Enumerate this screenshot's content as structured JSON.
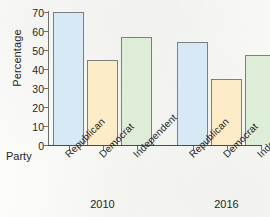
{
  "chart_data": {
    "type": "bar",
    "title": "",
    "xlabel": "Party",
    "ylabel": "Percentage",
    "ylim": [
      0,
      70
    ],
    "ytick_labels": [
      "0",
      "10",
      "20",
      "30",
      "40",
      "50",
      "60",
      "70"
    ],
    "ytick_values": [
      0,
      10,
      20,
      30,
      40,
      50,
      60,
      70
    ],
    "grid": false,
    "legend": "none",
    "categories": [
      "Republican",
      "Democrat",
      "Independent"
    ],
    "groups": [
      "2010",
      "2016"
    ],
    "series": [
      {
        "name": "2010",
        "values": [
          70,
          45,
          57
        ]
      },
      {
        "name": "2016",
        "values": [
          54,
          35,
          47.5
        ]
      }
    ],
    "bars": [
      {
        "group": "2010",
        "category": "Republican",
        "value": 70,
        "color": "#d6e9f5"
      },
      {
        "group": "2010",
        "category": "Democrat",
        "value": 45,
        "color": "#fcecc8"
      },
      {
        "group": "2010",
        "category": "Independent",
        "value": 57,
        "color": "#ddedd7"
      },
      {
        "group": "2016",
        "category": "Republican",
        "value": 54,
        "color": "#d6e9f5"
      },
      {
        "group": "2016",
        "category": "Democrat",
        "value": 35,
        "color": "#fcecc8"
      },
      {
        "group": "2016",
        "category": "Independent",
        "value": 47.5,
        "color": "#ddedd7"
      }
    ],
    "colors": {
      "republican": "#d6e9f5",
      "democrat": "#fcecc8",
      "independent": "#ddedd7",
      "bar_outline": "#7b7f82",
      "axis": "#4a4a4a",
      "text": "#1f1f1f",
      "background": "#fbfbf9"
    }
  }
}
